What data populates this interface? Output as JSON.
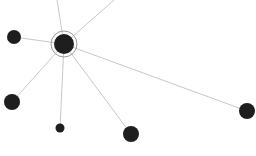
{
  "graph": {
    "background": "#ffffff",
    "edge_color": "#c8c8c8",
    "node_color": "#1e1e1e",
    "ring_color": "#9a9a9a",
    "center": {
      "id": "center",
      "x": 64,
      "y": 44,
      "r": 10,
      "ring_r": 13
    },
    "nodes": [
      {
        "id": "n-left-top",
        "x": 14,
        "y": 37,
        "r": 7
      },
      {
        "id": "n-left-bottom",
        "x": 12,
        "y": 102,
        "r": 8
      },
      {
        "id": "n-bottom-small",
        "x": 60,
        "y": 128,
        "r": 4.5
      },
      {
        "id": "n-bottom-mid",
        "x": 131,
        "y": 134,
        "r": 8
      },
      {
        "id": "n-right",
        "x": 247,
        "y": 111,
        "r": 8
      }
    ],
    "offscreen_edges": [
      {
        "id": "e-top",
        "x": 57,
        "y": 0
      },
      {
        "id": "e-top-right",
        "x": 114,
        "y": 0
      }
    ]
  }
}
